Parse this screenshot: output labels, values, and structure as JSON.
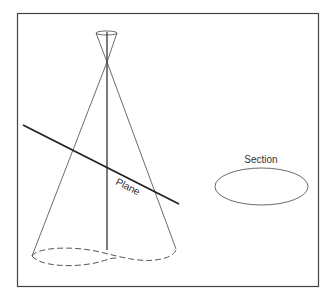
{
  "diagram": {
    "labels": {
      "plane": "Plane",
      "section": "Section"
    },
    "colors": {
      "frame": "#444444",
      "stroke": "#333333",
      "background": "#ffffff"
    }
  }
}
